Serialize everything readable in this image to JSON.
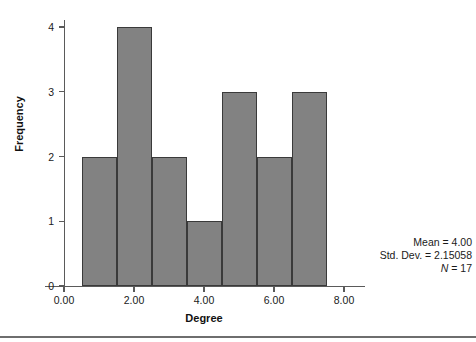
{
  "chart_data": {
    "type": "bar",
    "title": "",
    "subtitle": "",
    "xlabel": "Degree",
    "ylabel": "Frequency",
    "categories": [
      "0.5-1.5",
      "1.5-2.5",
      "2.5-3.5",
      "3.5-4.5",
      "4.5-5.5",
      "5.5-6.5",
      "6.5-7.5"
    ],
    "bin_centers": [
      1,
      2,
      3,
      4,
      5,
      6,
      7
    ],
    "bin_edges": [
      0.5,
      1.5,
      2.5,
      3.5,
      4.5,
      5.5,
      6.5,
      7.5
    ],
    "values": [
      2,
      4,
      2,
      1,
      3,
      2,
      3
    ],
    "bin_width": 1,
    "xlim": [
      0.0,
      8.0
    ],
    "ylim": [
      0,
      4
    ],
    "xticks": [
      0.0,
      2.0,
      4.0,
      6.0,
      8.0
    ],
    "xtick_labels": [
      "0.00",
      "2.00",
      "4.00",
      "6.00",
      "8.00"
    ],
    "yticks": [
      0,
      1,
      2,
      3,
      4
    ],
    "ytick_labels": [
      "0",
      "1",
      "2",
      "3",
      "4"
    ],
    "grid": false,
    "legend": null,
    "bar_color": "#828282",
    "bar_edge_color": "#3a3a3a",
    "axis_color": "#5a5a5a",
    "background_color": "#ffffff",
    "annotations": {
      "mean_label": "Mean = 4.00",
      "std_dev_label": "Std. Dev. = 2.15058",
      "n_symbol": "N",
      "n_value": "= 17",
      "position": "bottom-right"
    }
  }
}
